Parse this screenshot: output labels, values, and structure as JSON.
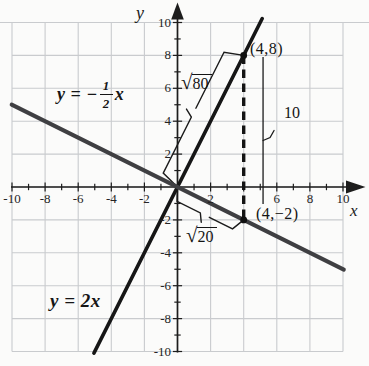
{
  "figure": {
    "background": "#fbfbfa",
    "grid_color": "#c9cbce",
    "axis_color": "#1d1d1d",
    "text_color": "#161616"
  },
  "chart_data": {
    "type": "line",
    "title": "",
    "xlabel": "x",
    "ylabel": "y",
    "xlim": [
      -10,
      10
    ],
    "ylim": [
      -10,
      10
    ],
    "grid": true,
    "grid_step": 2,
    "x_ticks": [
      {
        "v": -10,
        "t": "-10"
      },
      {
        "v": -8,
        "t": "-8"
      },
      {
        "v": -6,
        "t": "-6"
      },
      {
        "v": -4,
        "t": "-4"
      },
      {
        "v": -2,
        "t": "-2"
      },
      {
        "v": 2,
        "t": "2"
      },
      {
        "v": 6,
        "t": "6"
      },
      {
        "v": 8,
        "t": "8"
      },
      {
        "v": 10,
        "t": "10"
      }
    ],
    "y_ticks": [
      {
        "v": 10,
        "t": "10"
      },
      {
        "v": 8,
        "t": "8"
      },
      {
        "v": 6,
        "t": "6"
      },
      {
        "v": 4,
        "t": "4"
      },
      {
        "v": 2,
        "t": "2"
      },
      {
        "v": -2,
        "t": "-2"
      },
      {
        "v": -4,
        "t": "-4"
      },
      {
        "v": -6,
        "t": "-6"
      },
      {
        "v": -8,
        "t": "-8"
      },
      {
        "v": -10,
        "t": "-10"
      }
    ],
    "series": [
      {
        "name": "y = 2x",
        "slope": 2,
        "intercept": 0,
        "x_range": [
          -5.05,
          5.12
        ],
        "color": "#161616",
        "width": 3.6,
        "eq_text": "y = 2x"
      },
      {
        "name": "y = -1/2 x",
        "slope": -0.5,
        "intercept": 0,
        "x_range": [
          -10.02,
          10.05
        ],
        "color": "#3f3f42",
        "width": 4,
        "eq": {
          "prefix": "y = −",
          "num": "1",
          "den": "2",
          "suffix": "x"
        }
      }
    ],
    "points": [
      {
        "x": 4,
        "y": 8,
        "label": "(4,8)"
      },
      {
        "x": 4,
        "y": -2,
        "label": "(4,−2)"
      }
    ],
    "dashed_segment": {
      "from": {
        "x": 4,
        "y": 8
      },
      "to": {
        "x": 4,
        "y": -2
      }
    },
    "annotations": {
      "sqrt80": {
        "radical": "√",
        "value": "80",
        "from": [
          0,
          0
        ],
        "to": [
          4,
          8
        ],
        "side": 1,
        "offset": 19
      },
      "sqrt20": {
        "radical": "√",
        "value": "20",
        "from": [
          0,
          0
        ],
        "to": [
          4,
          -2
        ],
        "side": -1,
        "offset": 13
      },
      "measure": {
        "label": "10",
        "x": 5.17,
        "y_top": 7.9,
        "y_bottom": -1.03
      }
    }
  }
}
